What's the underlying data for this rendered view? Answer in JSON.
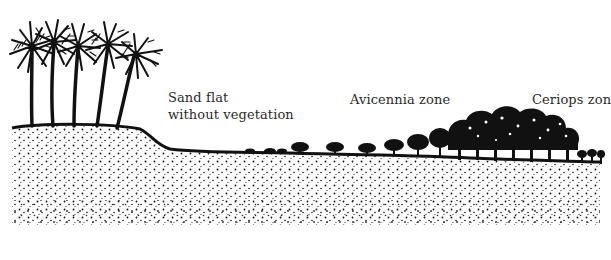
{
  "diagram": {
    "type": "coastal-zonation-cross-section",
    "zones": [
      {
        "id": "palm-bank",
        "label_lines": [],
        "description": "Coconut palms on raised sandy bank"
      },
      {
        "id": "sand-flat",
        "label_lines": [
          "Sand flat",
          "without vegetation"
        ]
      },
      {
        "id": "avicennia",
        "label_lines": [
          "Avicennia zone"
        ]
      },
      {
        "id": "ceriops",
        "label_lines": [
          "Ceriops zon"
        ]
      }
    ],
    "colors": {
      "ink": "#111111",
      "background": "#ffffff",
      "label_text": "#2a2a2a"
    }
  }
}
